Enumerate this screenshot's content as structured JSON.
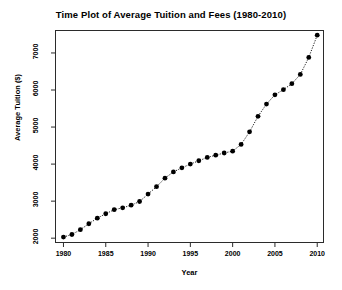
{
  "chart_data": {
    "type": "line",
    "title": "Time Plot of Average Tuition and Fees (1980-2010)",
    "xlabel": "Year",
    "ylabel": "Average Tuition ($)",
    "xlim": [
      1979.0,
      2010.8
    ],
    "ylim": [
      1870,
      7620
    ],
    "xticks": [
      1980,
      1985,
      1990,
      1995,
      2000,
      2005,
      2010
    ],
    "xtick_labels": [
      "1980",
      "1985",
      "1990",
      "1995",
      "2000",
      "2005",
      "2010"
    ],
    "yticks": [
      2000,
      3000,
      4000,
      5000,
      6000,
      7000
    ],
    "ytick_labels": [
      "2000",
      "3000",
      "4000",
      "5000",
      "6000",
      "7000"
    ],
    "grid": false,
    "legend": null,
    "marker": "filled-circle",
    "marker_color": "#000000",
    "line_style": "dotted",
    "line_color": "#000000",
    "x": [
      1980,
      1981,
      1982,
      1983,
      1984,
      1985,
      1986,
      1987,
      1988,
      1989,
      1990,
      1991,
      1992,
      1993,
      1994,
      1995,
      1996,
      1997,
      1998,
      1999,
      2000,
      2001,
      2002,
      2003,
      2004,
      2005,
      2006,
      2007,
      2008,
      2009,
      2010
    ],
    "values": [
      2030,
      2100,
      2230,
      2390,
      2540,
      2660,
      2770,
      2820,
      2890,
      2990,
      3190,
      3390,
      3620,
      3790,
      3900,
      4000,
      4090,
      4180,
      4240,
      4300,
      4350,
      4530,
      4870,
      5290,
      5620,
      5870,
      6010,
      6170,
      6420,
      6880,
      7480
    ],
    "series": [
      {
        "name": "Average Tuition and Fees",
        "values": [
          2030,
          2100,
          2230,
          2390,
          2540,
          2660,
          2770,
          2820,
          2890,
          2990,
          3190,
          3390,
          3620,
          3790,
          3900,
          4000,
          4090,
          4180,
          4240,
          4300,
          4350,
          4530,
          4870,
          5290,
          5620,
          5870,
          6010,
          6170,
          6420,
          6880,
          7480
        ]
      }
    ]
  }
}
